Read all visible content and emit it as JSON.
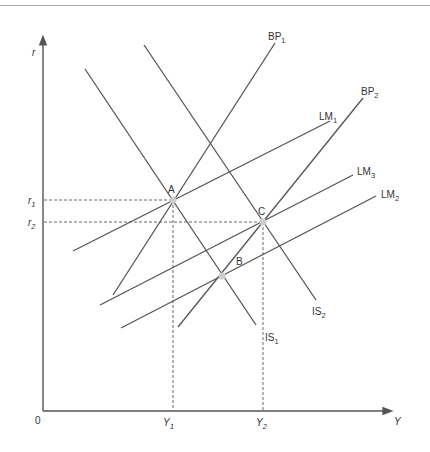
{
  "diagram": {
    "type": "IS-LM-BP diagram",
    "axes": {
      "y_axis_label": "r",
      "x_axis_label": "Y",
      "origin_label": "0",
      "y_ticks": [
        {
          "label": "r",
          "sub": "1"
        },
        {
          "label": "r",
          "sub": "2"
        }
      ],
      "x_ticks": [
        {
          "label": "Y",
          "sub": "1"
        },
        {
          "label": "Y",
          "sub": "2"
        }
      ]
    },
    "curves": [
      {
        "id": "BP1",
        "label": "BP",
        "sub": "1"
      },
      {
        "id": "BP2",
        "label": "BP",
        "sub": "2"
      },
      {
        "id": "LM1",
        "label": "LM",
        "sub": "1"
      },
      {
        "id": "LM2",
        "label": "LM",
        "sub": "2"
      },
      {
        "id": "LM3",
        "label": "LM",
        "sub": "3"
      },
      {
        "id": "IS1",
        "label": "IS",
        "sub": "1"
      },
      {
        "id": "IS2",
        "label": "IS",
        "sub": "2"
      }
    ],
    "points": [
      {
        "label": "A",
        "at": "Y1, r1"
      },
      {
        "label": "B",
        "at": "IS1 ∩ BP2 ∩ LM2"
      },
      {
        "label": "C",
        "at": "Y2, r2"
      }
    ]
  }
}
